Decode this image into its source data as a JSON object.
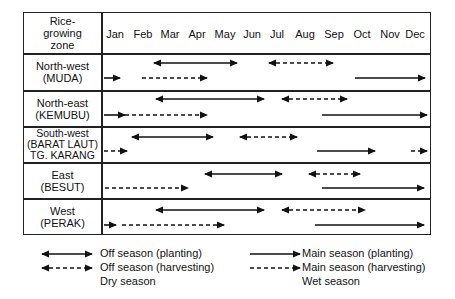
{
  "header": {
    "zone_label_lines": [
      "Rice-",
      "growing",
      "zone"
    ],
    "months": [
      "Jan",
      "Feb",
      "Mar",
      "Apr",
      "May",
      "Jun",
      "Jul",
      "Aug",
      "Sep",
      "Oct",
      "Nov",
      "Dec"
    ]
  },
  "zones": [
    {
      "name": "North-west",
      "sub": "(MUDA)",
      "sub2": ""
    },
    {
      "name": "North-east",
      "sub": "(KEMUBU)",
      "sub2": ""
    },
    {
      "name": "South-west",
      "sub": "(BARAT LAUT)",
      "sub2": "TG. KARANG"
    },
    {
      "name": "East",
      "sub": "(BESUT)",
      "sub2": ""
    },
    {
      "name": "West",
      "sub": "(PERAK)",
      "sub2": ""
    }
  ],
  "legend": {
    "off_planting": "Off season (planting)",
    "off_harvesting": "Off season (harvesting)",
    "dry": "Dry season",
    "main_planting": "Main season (planting)",
    "main_harvesting": "Main season (harvesting)",
    "wet": "Wet season"
  },
  "arrows": [
    {
      "zone": 0,
      "type": "off_planting",
      "x1": 154,
      "x2": 237,
      "y": 63
    },
    {
      "zone": 0,
      "type": "off_harvesting",
      "x1": 269,
      "x2": 333,
      "y": 63
    },
    {
      "zone": 0,
      "type": "main_planting_end",
      "x1": 104,
      "x2": 120,
      "y": 78
    },
    {
      "zone": 0,
      "type": "main_harvesting_end",
      "x1": 142,
      "x2": 207,
      "y": 78
    },
    {
      "zone": 0,
      "type": "main_planting",
      "x1": 355,
      "x2": 425,
      "y": 78
    },
    {
      "zone": 0,
      "type": "off_planting",
      "x1": 156,
      "x2": 264,
      "y": 99
    },
    {
      "zone": 0,
      "type": "off_harvesting",
      "x1": 282,
      "x2": 347,
      "y": 99
    },
    {
      "zone": 1,
      "type": "main_planting_end",
      "x1": 104,
      "x2": 125,
      "y": 115
    },
    {
      "zone": 1,
      "type": "main_harvesting_end",
      "x1": 125,
      "x2": 207,
      "y": 115
    },
    {
      "zone": 1,
      "type": "main_planting",
      "x1": 322,
      "x2": 427,
      "y": 115
    },
    {
      "zone": 2,
      "type": "off_planting",
      "x1": 132,
      "x2": 213,
      "y": 137
    },
    {
      "zone": 2,
      "type": "off_harvesting",
      "x1": 240,
      "x2": 297,
      "y": 137
    },
    {
      "zone": 2,
      "type": "main_harvesting_end",
      "x1": 104,
      "x2": 127,
      "y": 151
    },
    {
      "zone": 2,
      "type": "main_planting",
      "x1": 317,
      "x2": 375,
      "y": 151
    },
    {
      "zone": 2,
      "type": "main_harvesting_end",
      "x1": 411,
      "x2": 427,
      "y": 151
    },
    {
      "zone": 3,
      "type": "off_planting",
      "x1": 205,
      "x2": 282,
      "y": 174
    },
    {
      "zone": 3,
      "type": "off_harvesting",
      "x1": 309,
      "x2": 360,
      "y": 174
    },
    {
      "zone": 3,
      "type": "main_harvesting_end",
      "x1": 105,
      "x2": 188,
      "y": 188
    },
    {
      "zone": 3,
      "type": "main_planting",
      "x1": 322,
      "x2": 424,
      "y": 188
    },
    {
      "zone": 4,
      "type": "off_planting",
      "x1": 156,
      "x2": 264,
      "y": 210
    },
    {
      "zone": 4,
      "type": "off_harvesting",
      "x1": 282,
      "x2": 365,
      "y": 210
    },
    {
      "zone": 4,
      "type": "main_planting_end",
      "x1": 104,
      "x2": 116,
      "y": 225
    },
    {
      "zone": 4,
      "type": "main_harvesting_end",
      "x1": 122,
      "x2": 224,
      "y": 225
    },
    {
      "zone": 4,
      "type": "main_planting",
      "x1": 315,
      "x2": 424,
      "y": 225
    }
  ]
}
